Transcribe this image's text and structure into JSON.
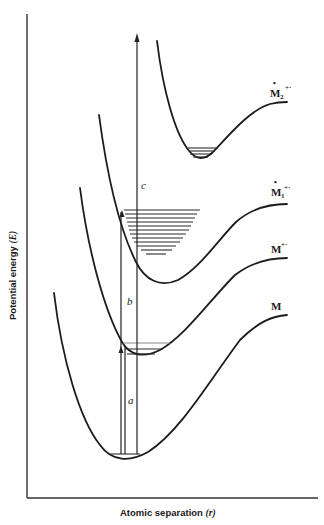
{
  "diagram": {
    "type": "potential-energy-curves",
    "axes": {
      "y_label": "Potential energy (E)",
      "y_label_main": "Potential energy ",
      "y_label_symbol": "(E)",
      "x_label_main": "Atomic separation ",
      "x_label_symbol": "(r)"
    },
    "curves": [
      {
        "id": "M",
        "label": "M",
        "superscript": ""
      },
      {
        "id": "M_ion",
        "label": "M",
        "superscript": "+·"
      },
      {
        "id": "M1_star",
        "label": "M",
        "subscript": "1",
        "dot": "•",
        "superscript": "+·"
      },
      {
        "id": "M2_star",
        "label": "M",
        "subscript": "2",
        "dot": "•",
        "superscript": "+·"
      }
    ],
    "transitions": {
      "a": "a",
      "b": "b",
      "c": "c"
    }
  }
}
